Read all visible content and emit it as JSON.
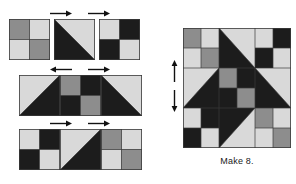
{
  "diagram": {
    "caption": "Make 8.",
    "colors": {
      "light": "#d9d9d9",
      "medium": "#8d8d8d",
      "dark": "#1c1c1c",
      "seam": "#3a3a3a",
      "arrow": "#111111",
      "background": "#ffffff"
    },
    "rows": [
      {
        "name": "top-unit-row",
        "arrows": [
          "right",
          "right"
        ],
        "units": [
          {
            "name": "four-patch-medium-light",
            "type": "four-patch",
            "patches": [
              "medium",
              "light",
              "light",
              "medium"
            ]
          },
          {
            "name": "half-square-triangle-dark-light",
            "type": "hst",
            "diagonal": "tl-br",
            "patches": [
              "dark",
              "light"
            ]
          },
          {
            "name": "four-patch-light-dark",
            "type": "four-patch",
            "patches": [
              "light",
              "dark",
              "dark",
              "light"
            ]
          }
        ]
      },
      {
        "name": "middle-unit-row",
        "arrows": [
          "left",
          "right"
        ],
        "units": [
          {
            "name": "half-square-triangle-light-dark",
            "type": "hst",
            "diagonal": "tr-bl",
            "patches": [
              "light",
              "dark"
            ]
          },
          {
            "name": "four-patch-medium-dark",
            "type": "four-patch",
            "patches": [
              "medium",
              "dark",
              "dark",
              "medium"
            ]
          },
          {
            "name": "half-square-triangle-dark-light-mirrored",
            "type": "hst",
            "diagonal": "tl-br",
            "patches": [
              "dark",
              "light"
            ]
          }
        ]
      },
      {
        "name": "bottom-unit-row",
        "arrows": [
          "right",
          "right"
        ],
        "units": [
          {
            "name": "four-patch-light-dark",
            "type": "four-patch",
            "patches": [
              "light",
              "dark",
              "dark",
              "light"
            ]
          },
          {
            "name": "half-square-triangle-light-dark",
            "type": "hst",
            "diagonal": "tr-bl",
            "patches": [
              "light",
              "dark"
            ]
          },
          {
            "name": "four-patch-medium-light",
            "type": "four-patch",
            "patches": [
              "medium",
              "light",
              "light",
              "medium"
            ]
          }
        ]
      }
    ],
    "assembled_block": {
      "name": "assembled-quilt-block",
      "side_arrows": [
        "up",
        "down"
      ],
      "grid": [
        [
          "four-patch-medium-light",
          "hst-dark-light",
          "four-patch-light-dark"
        ],
        [
          "hst-light-dark",
          "four-patch-medium-dark",
          "hst-dark-light"
        ],
        [
          "four-patch-light-dark",
          "hst-light-dark",
          "four-patch-medium-light"
        ]
      ]
    }
  }
}
